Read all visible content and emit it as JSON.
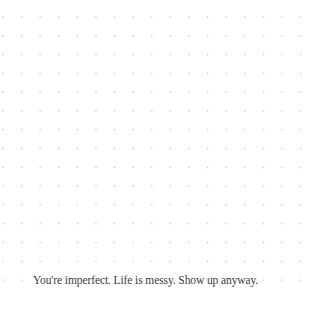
{
  "page": {
    "background_color": "#ffffff",
    "grid": {
      "style": "dot-grid",
      "dot_color": "#c9c9c9"
    }
  },
  "quote": {
    "text": "You're imperfect. Life is messy. Show up anyway.",
    "color": "#3a3a3a"
  }
}
